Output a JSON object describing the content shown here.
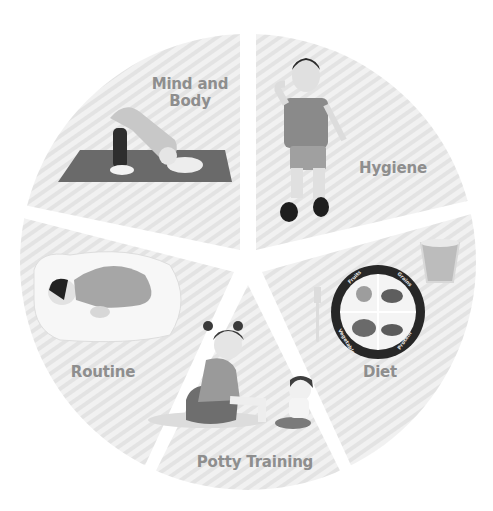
{
  "diagram": {
    "type": "segmented-circle",
    "center": [
      248,
      262
    ],
    "radius": 228,
    "palette": {
      "sector_fill": "#efefef",
      "sector_stripe": "#e2e2e2",
      "label_text": "#8e8e8e",
      "gap": "#ffffff"
    },
    "sectors": [
      {
        "id": "mind-and-body",
        "label_line1": "Mind and",
        "label_line2": "Body",
        "illustration": "child-yoga-downward-dog-on-mat"
      },
      {
        "id": "hygiene",
        "label": "Hygiene",
        "illustration": "boy-brushing-teeth"
      },
      {
        "id": "diet",
        "label": "Diet",
        "illustration": "plate-with-fork-and-glass"
      },
      {
        "id": "potty-training",
        "label": "Potty Training",
        "illustration": "two-children-on-potties"
      },
      {
        "id": "routine",
        "label": "Routine",
        "illustration": "baby-sleeping-on-pillow"
      }
    ],
    "plate": {
      "sections": [
        "Fruits",
        "Grains",
        "Vegetables",
        "Protein"
      ]
    }
  }
}
